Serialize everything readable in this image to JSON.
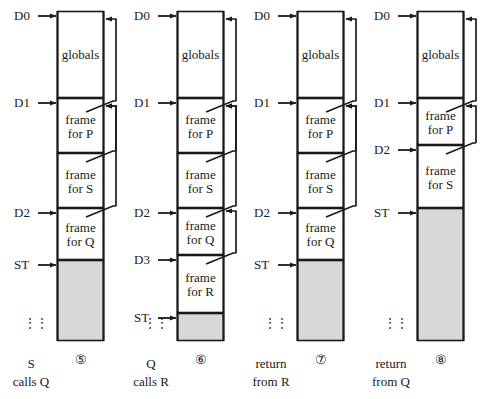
{
  "figure": {
    "labels": {
      "globals": "globals",
      "frame_prefix": "frame",
      "for_prefix": "for"
    },
    "dots_glyph": "⋮"
  },
  "geometry": {
    "box_left": [
      57,
      177,
      297,
      417
    ],
    "box_width": 47,
    "box_top": 11,
    "box_bottom": 341,
    "link_x": [
      116,
      236,
      356,
      476
    ],
    "arrow_x_start": [
      38,
      158,
      278,
      398
    ]
  },
  "colors": {
    "stroke": "#1a1a1a",
    "fill_used": "#ffffff",
    "fill_free": "#d8d8d8",
    "text": "#1a1a1a",
    "page_bg": "#ffffff"
  },
  "columns": [
    {
      "id": "panel-5",
      "fignum": "⑤",
      "caption_line1": "S",
      "caption_line2": "calls Q",
      "caption_dots": "⋮",
      "pointers": [
        {
          "name": "D0",
          "y": 16
        },
        {
          "name": "D1",
          "y": 103
        },
        {
          "name": "D2",
          "y": 213
        },
        {
          "name": "ST",
          "y": 265
        }
      ],
      "frames": [
        {
          "name": "globals",
          "line1": "globals",
          "line2": "",
          "top": 11,
          "bottom": 98,
          "free": false
        },
        {
          "name": "frame-P",
          "line1": "frame",
          "line2": "for P",
          "top": 98,
          "bottom": 153,
          "free": false
        },
        {
          "name": "frame-S",
          "line1": "frame",
          "line2": "for S",
          "top": 153,
          "bottom": 208,
          "free": false
        },
        {
          "name": "frame-Q",
          "line1": "frame",
          "line2": "for Q",
          "top": 208,
          "bottom": 260,
          "free": false
        },
        {
          "name": "free-space",
          "line1": "",
          "line2": "",
          "top": 260,
          "bottom": 341,
          "free": true
        }
      ],
      "links": [
        {
          "from_y": 103,
          "to_y": 16
        },
        {
          "from_y": 153,
          "to_y": 103
        },
        {
          "from_y": 208,
          "to_y": 103
        }
      ]
    },
    {
      "id": "panel-6",
      "fignum": "⑥",
      "caption_line1": "Q",
      "caption_line2": "calls R",
      "caption_dots": "⋮",
      "pointers": [
        {
          "name": "D0",
          "y": 16
        },
        {
          "name": "D1",
          "y": 103
        },
        {
          "name": "D2",
          "y": 213
        },
        {
          "name": "D3",
          "y": 260
        },
        {
          "name": "ST",
          "y": 318
        }
      ],
      "frames": [
        {
          "name": "globals",
          "line1": "globals",
          "line2": "",
          "top": 11,
          "bottom": 98,
          "free": false
        },
        {
          "name": "frame-P",
          "line1": "frame",
          "line2": "for P",
          "top": 98,
          "bottom": 153,
          "free": false
        },
        {
          "name": "frame-S",
          "line1": "frame",
          "line2": "for S",
          "top": 153,
          "bottom": 208,
          "free": false
        },
        {
          "name": "frame-Q",
          "line1": "frame",
          "line2": "for Q",
          "top": 208,
          "bottom": 255,
          "free": false
        },
        {
          "name": "frame-R",
          "line1": "frame",
          "line2": "for R",
          "top": 255,
          "bottom": 313,
          "free": false
        },
        {
          "name": "free-space",
          "line1": "",
          "line2": "",
          "top": 313,
          "bottom": 341,
          "free": true
        }
      ],
      "links": [
        {
          "from_y": 103,
          "to_y": 16
        },
        {
          "from_y": 153,
          "to_y": 103
        },
        {
          "from_y": 208,
          "to_y": 103
        },
        {
          "from_y": 255,
          "to_y": 208
        }
      ]
    },
    {
      "id": "panel-7",
      "fignum": "⑦",
      "caption_line1": "return",
      "caption_line2": "from R",
      "caption_dots": "⋮",
      "pointers": [
        {
          "name": "D0",
          "y": 16
        },
        {
          "name": "D1",
          "y": 103
        },
        {
          "name": "D2",
          "y": 213
        },
        {
          "name": "ST",
          "y": 265
        }
      ],
      "frames": [
        {
          "name": "globals",
          "line1": "globals",
          "line2": "",
          "top": 11,
          "bottom": 98,
          "free": false
        },
        {
          "name": "frame-P",
          "line1": "frame",
          "line2": "for P",
          "top": 98,
          "bottom": 153,
          "free": false
        },
        {
          "name": "frame-S",
          "line1": "frame",
          "line2": "for S",
          "top": 153,
          "bottom": 208,
          "free": false
        },
        {
          "name": "frame-Q",
          "line1": "frame",
          "line2": "for Q",
          "top": 208,
          "bottom": 260,
          "free": false
        },
        {
          "name": "free-space",
          "line1": "",
          "line2": "",
          "top": 260,
          "bottom": 341,
          "free": true
        }
      ],
      "links": [
        {
          "from_y": 103,
          "to_y": 16
        },
        {
          "from_y": 153,
          "to_y": 103
        },
        {
          "from_y": 208,
          "to_y": 103
        }
      ]
    },
    {
      "id": "panel-8",
      "fignum": "⑧",
      "caption_line1": "return",
      "caption_line2": "from Q",
      "caption_dots": "⋮",
      "pointers": [
        {
          "name": "D0",
          "y": 16
        },
        {
          "name": "D1",
          "y": 103
        },
        {
          "name": "D2",
          "y": 150
        },
        {
          "name": "ST",
          "y": 213
        }
      ],
      "frames": [
        {
          "name": "globals",
          "line1": "globals",
          "line2": "",
          "top": 11,
          "bottom": 98,
          "free": false
        },
        {
          "name": "frame-P",
          "line1": "frame",
          "line2": "for P",
          "top": 98,
          "bottom": 145,
          "free": false
        },
        {
          "name": "frame-S",
          "line1": "frame",
          "line2": "for S",
          "top": 145,
          "bottom": 208,
          "free": false
        },
        {
          "name": "free-space",
          "line1": "",
          "line2": "",
          "top": 208,
          "bottom": 341,
          "free": true
        }
      ],
      "links": [
        {
          "from_y": 103,
          "to_y": 16
        },
        {
          "from_y": 145,
          "to_y": 103
        }
      ]
    }
  ]
}
